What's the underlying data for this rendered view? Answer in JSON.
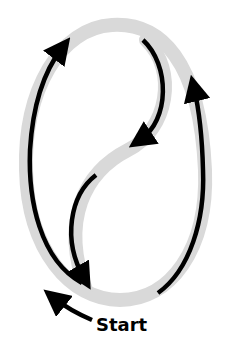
{
  "diagram": {
    "label_start": "Start",
    "colors": {
      "track": "#d9d9d9",
      "arrow": "#000000",
      "background": "#ffffff"
    }
  }
}
